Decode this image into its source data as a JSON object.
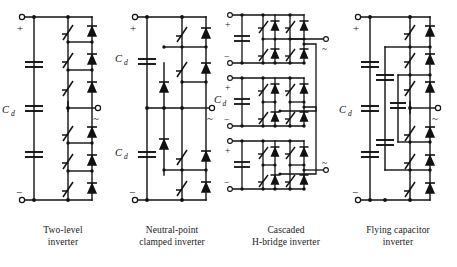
{
  "figure": {
    "background_color": "#ffffff",
    "line_color": "#111111",
    "title": ""
  },
  "circuits": [
    {
      "id": "two-level",
      "caption_line1": "Two-level",
      "caption_line2": "inverter",
      "dc_label": "Cd",
      "dc_label_base": "C",
      "dc_label_sub": "d",
      "plus_terminal": "+",
      "minus_terminal": "−",
      "ac_terminal": "~",
      "switch_count": 6,
      "diode_count": 6,
      "capacitor_count": 3,
      "ac_terminals": 1
    },
    {
      "id": "neutral-point-clamped",
      "caption_line1": "Neutral-point",
      "caption_line2": "clamped inverter",
      "dc_label_upper": "Cd",
      "dc_label_lower": "Cd",
      "dc_label_base": "C",
      "dc_label_sub": "d",
      "plus_terminal": "+",
      "minus_terminal": "−",
      "ac_terminal": "~",
      "switch_count": 4,
      "diode_count": 4,
      "clamping_diode_count": 2,
      "capacitor_count": 2,
      "ac_terminals": 1
    },
    {
      "id": "cascaded-h-bridge",
      "caption_line1": "Cascaded",
      "caption_line2": "H-bridge inverter",
      "dc_label": "Cd",
      "dc_label_base": "C",
      "dc_label_sub": "d",
      "plus_terminal": "+",
      "minus_terminal": "−",
      "ac_terminal": "~",
      "stage_count": 3,
      "switch_count": 12,
      "diode_count": 12,
      "capacitor_count": 3,
      "ac_terminals": 2
    },
    {
      "id": "flying-capacitor",
      "caption_line1": "Flying capacitor",
      "caption_line2": "inverter",
      "dc_label": "Cd",
      "dc_label_base": "C",
      "dc_label_sub": "d",
      "plus_terminal": "+",
      "minus_terminal": "−",
      "ac_terminal": "~",
      "switch_count": 6,
      "diode_count": 6,
      "dc_capacitor_count": 3,
      "flying_capacitor_count": 4,
      "ac_terminals": 1
    }
  ]
}
